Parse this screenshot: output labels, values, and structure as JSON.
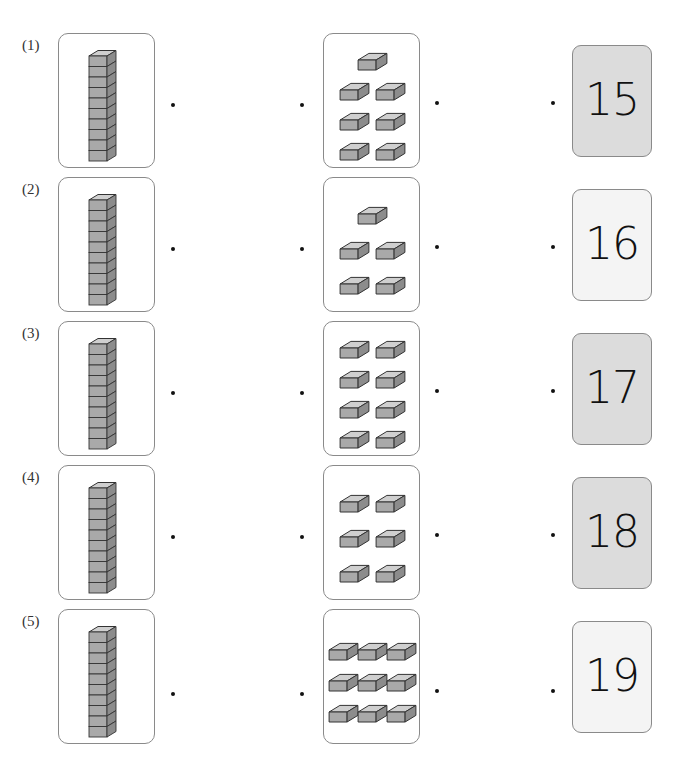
{
  "exercise": {
    "rows": [
      {
        "label": "(1)",
        "rod_units": 10,
        "loose_blocks": 7,
        "layout": [
          1,
          2,
          2,
          2
        ],
        "number": "15",
        "number_bg": "gray"
      },
      {
        "label": "(2)",
        "rod_units": 10,
        "loose_blocks": 5,
        "layout": [
          1,
          2,
          2
        ],
        "number": "16",
        "number_bg": "light"
      },
      {
        "label": "(3)",
        "rod_units": 10,
        "loose_blocks": 8,
        "layout": [
          2,
          2,
          2,
          2
        ],
        "number": "17",
        "number_bg": "gray"
      },
      {
        "label": "(4)",
        "rod_units": 10,
        "loose_blocks": 6,
        "layout": [
          2,
          2,
          2
        ],
        "number": "18",
        "number_bg": "gray"
      },
      {
        "label": "(5)",
        "rod_units": 10,
        "loose_blocks": 9,
        "layout": [
          3,
          3,
          3
        ],
        "number": "19",
        "number_bg": "light"
      }
    ]
  },
  "colors": {
    "block_top": "#cfcfcf",
    "block_front": "#a9a9a9",
    "block_side": "#8c8c8c",
    "outline": "#333333"
  }
}
